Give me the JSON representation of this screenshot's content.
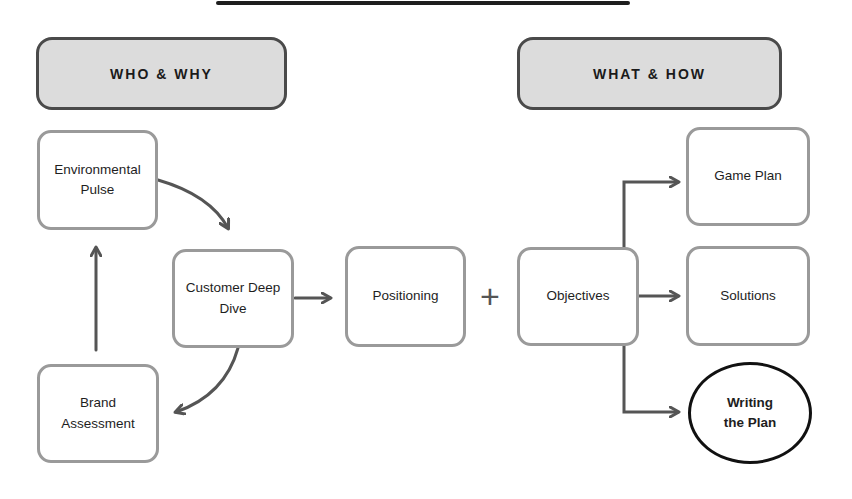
{
  "diagram": {
    "headers": [
      {
        "id": "who-why",
        "label": "WHO & WHY"
      },
      {
        "id": "what-how",
        "label": "WHAT & HOW"
      }
    ],
    "nodes": [
      {
        "id": "environmental-pulse",
        "label": "Environmental Pulse"
      },
      {
        "id": "customer-deep-dive",
        "label": "Customer Deep Dive"
      },
      {
        "id": "brand-assessment",
        "label": "Brand Assessment"
      },
      {
        "id": "positioning",
        "label": "Positioning"
      },
      {
        "id": "objectives",
        "label": "Objectives"
      },
      {
        "id": "game-plan",
        "label": "Game Plan"
      },
      {
        "id": "solutions",
        "label": "Solutions"
      },
      {
        "id": "writing-the-plan",
        "label": "Writing the Plan",
        "highlighted": true
      }
    ],
    "operator": "+",
    "edges": [
      {
        "from": "environmental-pulse",
        "to": "customer-deep-dive",
        "style": "curved"
      },
      {
        "from": "customer-deep-dive",
        "to": "brand-assessment",
        "style": "curved"
      },
      {
        "from": "brand-assessment",
        "to": "environmental-pulse",
        "style": "straight"
      },
      {
        "from": "customer-deep-dive",
        "to": "positioning",
        "style": "straight"
      },
      {
        "from": "positioning",
        "to": "objectives",
        "style": "plus"
      },
      {
        "from": "objectives",
        "to": "game-plan",
        "style": "elbow"
      },
      {
        "from": "objectives",
        "to": "solutions",
        "style": "straight"
      },
      {
        "from": "objectives",
        "to": "writing-the-plan",
        "style": "elbow"
      }
    ],
    "colors": {
      "header_fill": "#dcdcdc",
      "header_border": "#4a4a4a",
      "node_border": "#9a9a9a",
      "highlight_border": "#111111",
      "arrow": "#555555"
    }
  }
}
